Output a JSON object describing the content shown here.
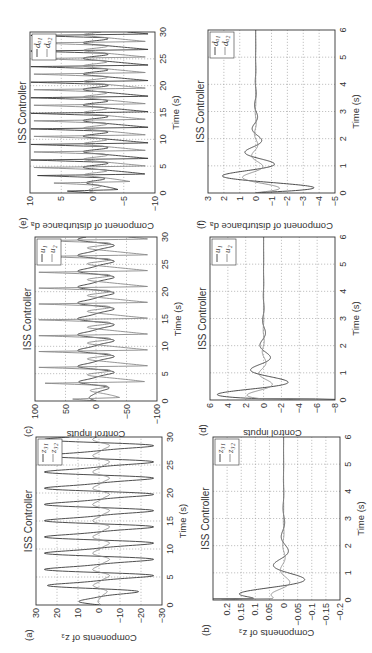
{
  "figure": {
    "orientation": "rotated-90-ccw",
    "colors": {
      "series1": "#3a3a3a",
      "series2": "#8a8a8a",
      "axis": "#333333",
      "grid": "#9a9a9a"
    }
  },
  "chart_data": [
    {
      "id": "a",
      "panel_label": "(a)",
      "type": "line",
      "title": "ISS Controller",
      "xlabel": "Time (s)",
      "ylabel": "Components of z₃",
      "xlim": [
        0,
        30
      ],
      "ylim": [
        -30,
        30
      ],
      "xticks": [
        "0",
        "5",
        "10",
        "15",
        "20",
        "25",
        "30"
      ],
      "yticks": [
        "30",
        "20",
        "10",
        "0",
        "−10",
        "−20",
        "−30"
      ],
      "ytick_values": [
        30,
        20,
        10,
        0,
        -10,
        -20,
        -30
      ],
      "grid": true,
      "legend_position": "upper right",
      "series": [
        {
          "name": "z31",
          "legend": "z₃₁",
          "kind": "sustained",
          "amp": 26,
          "period": 2.9,
          "offset": 0,
          "settle": 0
        },
        {
          "name": "z32",
          "legend": "z₃₂",
          "kind": "sustained",
          "amp": 4,
          "period": 2.9,
          "offset": -1,
          "settle": 0
        }
      ]
    },
    {
      "id": "b",
      "panel_label": "(b)",
      "type": "line",
      "title": "ISS Controller",
      "xlabel": "Time (s)",
      "ylabel": "Components of z₃",
      "xlim": [
        0,
        6
      ],
      "ylim": [
        -0.2,
        0.25
      ],
      "xticks": [
        "0",
        "1",
        "2",
        "3",
        "4",
        "5",
        "6"
      ],
      "yticks": [
        "0.2",
        "0.15",
        "0.1",
        "0.05",
        "0",
        "−0.05",
        "−0.1",
        "−0.15",
        "−0.2"
      ],
      "ytick_values": [
        0.2,
        0.15,
        0.1,
        0.05,
        0,
        -0.05,
        -0.1,
        -0.15,
        -0.2
      ],
      "grid": true,
      "legend_position": "upper right",
      "series": [
        {
          "name": "z31",
          "legend": "z₃₁",
          "kind": "damped",
          "y0": 0.25,
          "amp": 0.22,
          "freq": 1.9,
          "decay": 1.4
        },
        {
          "name": "z32",
          "legend": "z₃₂",
          "kind": "damped",
          "y0": 0.11,
          "amp": 0.06,
          "freq": 2.2,
          "decay": 1.5
        }
      ]
    },
    {
      "id": "c",
      "panel_label": "(c)",
      "type": "line",
      "title": "ISS Controller",
      "xlabel": "Time (s)",
      "ylabel": "Control inputs",
      "xlim": [
        0,
        30
      ],
      "ylim": [
        -100,
        100
      ],
      "xticks": [
        "0",
        "5",
        "10",
        "15",
        "20",
        "25",
        "30"
      ],
      "yticks": [
        "100",
        "50",
        "0",
        "−50",
        "−100"
      ],
      "ytick_values": [
        100,
        50,
        0,
        -50,
        -100
      ],
      "grid": true,
      "legend_position": "upper right",
      "series": [
        {
          "name": "u1",
          "legend": "u₁",
          "kind": "sustained",
          "amp": 30,
          "period": 2.9,
          "offset": 0,
          "settle": 0
        },
        {
          "name": "u2",
          "legend": "u₂",
          "kind": "spiky",
          "amp": 95,
          "period": 2.9,
          "offset": 0,
          "settle": 0
        }
      ]
    },
    {
      "id": "d",
      "panel_label": "(d)",
      "type": "line",
      "title": "ISS Controller",
      "xlabel": "Time (s)",
      "ylabel": "Control inputs",
      "xlim": [
        0,
        6
      ],
      "ylim": [
        -8,
        6
      ],
      "xticks": [
        "0",
        "1",
        "2",
        "3",
        "4",
        "5",
        "6"
      ],
      "yticks": [
        "6",
        "4",
        "2",
        "0",
        "−2",
        "−4",
        "−6",
        "−8"
      ],
      "ytick_values": [
        6,
        4,
        2,
        0,
        -2,
        -4,
        -6,
        -8
      ],
      "grid": true,
      "legend_position": "upper right",
      "series": [
        {
          "name": "u1",
          "legend": "u₁",
          "kind": "damped",
          "y0": -6,
          "amp": 7,
          "freq": 2.2,
          "decay": 1.4
        },
        {
          "name": "u2",
          "legend": "u₂",
          "kind": "damped",
          "y0": -2,
          "amp": 2.5,
          "freq": 2.5,
          "decay": 1.6
        }
      ]
    },
    {
      "id": "e",
      "panel_label": "(e)",
      "type": "line",
      "title": "ISS Controller",
      "xlabel": "Time (s)",
      "ylabel": "Component of disturbance dₐ",
      "xlim": [
        0,
        30
      ],
      "ylim": [
        -10,
        10
      ],
      "xticks": [
        "0",
        "5",
        "10",
        "15",
        "20",
        "25",
        "30"
      ],
      "yticks": [
        "10",
        "5",
        "0",
        "−5",
        "−10"
      ],
      "ytick_values": [
        10,
        5,
        0,
        -5,
        -10
      ],
      "grid": true,
      "legend_position": "upper right",
      "series": [
        {
          "name": "da1",
          "legend": "dₐ₁",
          "kind": "spiky",
          "amp": 10,
          "period": 2.9,
          "offset": 0,
          "settle": 0
        },
        {
          "name": "da2",
          "legend": "dₐ₂",
          "kind": "spiky",
          "amp": 9.5,
          "period": 2.9,
          "offset": 1.4,
          "settle": 0
        }
      ]
    },
    {
      "id": "f",
      "panel_label": "(f)",
      "type": "line",
      "title": "ISS Controller",
      "xlabel": "Time (s)",
      "ylabel": "Component of disturbance dₐ",
      "xlim": [
        0,
        6
      ],
      "ylim": [
        -5,
        3
      ],
      "xticks": [
        "0",
        "1",
        "2",
        "3",
        "4",
        "5",
        "6"
      ],
      "yticks": [
        "3",
        "2",
        "1",
        "0",
        "−1",
        "−2",
        "−3",
        "−4",
        "−5"
      ],
      "ytick_values": [
        3,
        2,
        1,
        0,
        -1,
        -2,
        -3,
        -4,
        -5
      ],
      "grid": true,
      "legend_position": "upper right",
      "series": [
        {
          "name": "da1",
          "legend": "dₐ₁",
          "kind": "damped",
          "y0": 0,
          "amp": -4.8,
          "freq": 2.3,
          "decay": 1.3,
          "phase": 0.0
        },
        {
          "name": "da2",
          "legend": "dₐ₂",
          "kind": "damped",
          "y0": 0,
          "amp": -2.0,
          "freq": 2.5,
          "decay": 1.5,
          "phase": 0.0
        }
      ]
    }
  ],
  "layout": {
    "panels": {
      "a": {
        "x": 48,
        "y": 36,
        "w": 168,
        "h": 126
      },
      "c": {
        "x": 252,
        "y": 35,
        "w": 164,
        "h": 122
      },
      "e": {
        "x": 460,
        "y": 30,
        "w": 161,
        "h": 125
      },
      "b": {
        "x": 53,
        "y": 213,
        "w": 163,
        "h": 127
      },
      "d": {
        "x": 253,
        "y": 210,
        "w": 163,
        "h": 125
      },
      "f": {
        "x": 460,
        "y": 208,
        "w": 163,
        "h": 127
      }
    }
  }
}
